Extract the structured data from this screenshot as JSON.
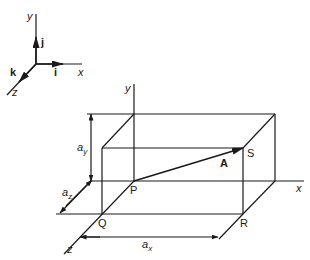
{
  "figure": {
    "type": "3d-vector-box-diagram",
    "stroke_color": "#1a1a1a",
    "background": "#ffffff"
  },
  "reference_axes": {
    "axis_labels": {
      "x": "x",
      "y": "y",
      "z": "z"
    },
    "unit_vectors": {
      "i": "i",
      "j": "j",
      "k": "k"
    }
  },
  "box": {
    "axis_labels": {
      "x": "x",
      "y": "y",
      "z": "z"
    },
    "points": {
      "P": "P",
      "Q": "Q",
      "R": "R",
      "S": "S"
    },
    "vector_label": "A",
    "dimensions": {
      "ax": {
        "base": "a",
        "sub": "x"
      },
      "ay": {
        "base": "a",
        "sub": "y"
      },
      "az": {
        "base": "a",
        "sub": "z"
      }
    }
  }
}
